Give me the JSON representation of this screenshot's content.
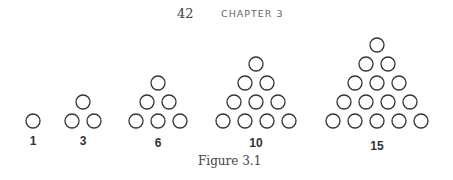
{
  "header": {
    "page_number": "42",
    "chapter": "CHAPTER 3"
  },
  "figure": {
    "caption": "Figure 3.1",
    "circle_radius": 7,
    "stroke_color": "#333333",
    "h_spacing": 22,
    "v_spacing": 19,
    "base_y": 121,
    "label_y": 134,
    "triangles": [
      {
        "label": "1",
        "rows": 1,
        "center_x": 33
      },
      {
        "label": "3",
        "rows": 2,
        "center_x": 83
      },
      {
        "label": "6",
        "rows": 3,
        "center_x": 158
      },
      {
        "label": "10",
        "rows": 4,
        "center_x": 256
      },
      {
        "label": "15",
        "rows": 5,
        "center_x": 377
      }
    ]
  }
}
